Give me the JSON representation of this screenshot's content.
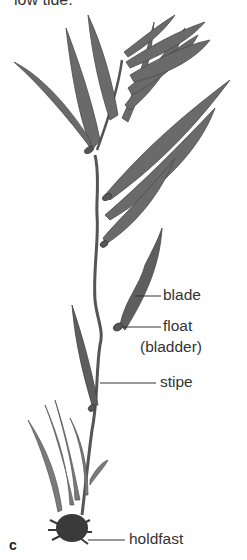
{
  "caption_top": "low tide.",
  "panel_letter": "c",
  "labels": {
    "blade": "blade",
    "float": "float",
    "bladder": "(bladder)",
    "stipe": "stipe",
    "holdfast": "holdfast"
  },
  "colors": {
    "kelp_dark": "#4a4a4a",
    "kelp_mid": "#6e6e6e",
    "leader_line": "#333333",
    "background": "#ffffff"
  }
}
